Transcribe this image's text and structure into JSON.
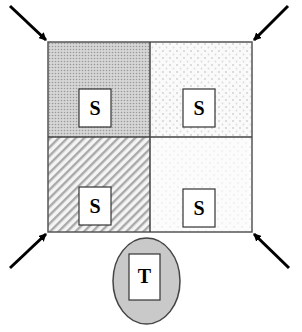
{
  "diagram": {
    "quadrants": [
      {
        "position": "top-left",
        "label": "S",
        "fill": "dense-dot",
        "color": "#c8c8c8"
      },
      {
        "position": "top-right",
        "label": "S",
        "fill": "sparse-dot",
        "color": "#ececec"
      },
      {
        "position": "bottom-left",
        "label": "S",
        "fill": "diagonal-hatch",
        "color": "#bdbdbd"
      },
      {
        "position": "bottom-right",
        "label": "S",
        "fill": "fine-dot",
        "color": "#f1f1f1"
      }
    ],
    "arrows": [
      {
        "from": "top-left-outside",
        "to": "top-left-corner"
      },
      {
        "from": "top-right-outside",
        "to": "top-right-corner"
      },
      {
        "from": "bottom-left-outside",
        "to": "bottom-left-corner"
      },
      {
        "from": "bottom-right-outside",
        "to": "bottom-right-corner"
      }
    ],
    "bottom_node": {
      "label": "T",
      "shape": "ellipse",
      "fill": "#c9c9c9"
    }
  }
}
